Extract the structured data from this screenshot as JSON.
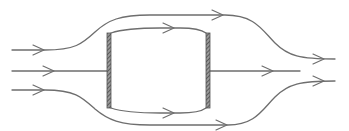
{
  "diagram": {
    "type": "flow-around-obstacle",
    "colors": {
      "background": "#ffffff",
      "stroke": "#6e6e6e",
      "plate": "#555555"
    },
    "plates": [
      {
        "name": "left-plate",
        "x": 107,
        "y_top": 33,
        "y_bottom": 108,
        "width": 4
      },
      {
        "name": "right-plate",
        "x": 206,
        "y_top": 33,
        "y_bottom": 108,
        "width": 4
      }
    ],
    "streamlines": [
      {
        "name": "top-outer",
        "direction": "right",
        "arrows": 3
      },
      {
        "name": "upper-inner",
        "direction": "right",
        "arrows": 1
      },
      {
        "name": "middle",
        "direction": "right",
        "arrows": 2
      },
      {
        "name": "lower-inner",
        "direction": "right",
        "arrows": 1
      },
      {
        "name": "bottom-outer",
        "direction": "right",
        "arrows": 3
      }
    ]
  }
}
